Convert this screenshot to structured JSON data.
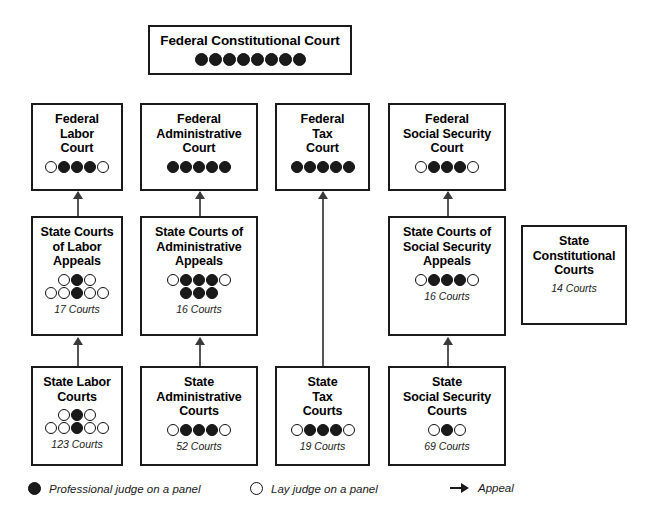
{
  "diagram": {
    "boxes": [
      {
        "id": "federal-constitutional-court",
        "title": "Federal Constitutional Court",
        "count": "",
        "x": 148,
        "y": 25,
        "w": 204,
        "h": 50,
        "dot_rows": [
          [
            "filled",
            "filled",
            "filled",
            "filled",
            "filled",
            "filled",
            "filled",
            "filled"
          ]
        ]
      },
      {
        "id": "federal-labor-court",
        "title": "Federal\nLabor\nCourt",
        "count": "",
        "x": 31,
        "y": 103,
        "w": 92,
        "h": 88,
        "dot_rows": [
          [
            "open",
            "filled",
            "filled",
            "filled",
            "open"
          ]
        ]
      },
      {
        "id": "federal-administrative-court",
        "title": "Federal\nAdministrative\nCourt",
        "count": "",
        "x": 140,
        "y": 103,
        "w": 118,
        "h": 88,
        "dot_rows": [
          [
            "filled",
            "filled",
            "filled",
            "filled",
            "filled"
          ]
        ]
      },
      {
        "id": "federal-tax-court",
        "title": "Federal\nTax\nCourt",
        "count": "",
        "x": 275,
        "y": 103,
        "w": 95,
        "h": 88,
        "dot_rows": [
          [
            "filled",
            "filled",
            "filled",
            "filled",
            "filled"
          ]
        ]
      },
      {
        "id": "federal-social-security-court",
        "title": "Federal\nSocial Security\nCourt",
        "count": "",
        "x": 388,
        "y": 103,
        "w": 118,
        "h": 88,
        "dot_rows": [
          [
            "open",
            "filled",
            "filled",
            "filled",
            "open"
          ]
        ]
      },
      {
        "id": "state-courts-of-labor-appeals",
        "title": "State Courts\nof Labor\nAppeals",
        "count": "17 Courts",
        "x": 31,
        "y": 216,
        "w": 92,
        "h": 120,
        "dot_rows": [
          [
            "open",
            "filled",
            "open"
          ],
          [
            "open",
            "open",
            "filled",
            "open",
            "open"
          ]
        ]
      },
      {
        "id": "state-courts-of-administrative-appeals",
        "title": "State Courts of\nAdministrative\nAppeals",
        "count": "16 Courts",
        "x": 140,
        "y": 216,
        "w": 118,
        "h": 120,
        "dot_rows": [
          [
            "open",
            "filled",
            "filled",
            "filled",
            "open"
          ],
          [
            "filled",
            "filled",
            "filled"
          ]
        ]
      },
      {
        "id": "state-courts-of-social-security-appeals",
        "title": "State Courts of\nSocial Security\nAppeals",
        "count": "16 Courts",
        "x": 388,
        "y": 216,
        "w": 118,
        "h": 120,
        "dot_rows": [
          [
            "open",
            "filled",
            "filled",
            "filled",
            "open"
          ]
        ]
      },
      {
        "id": "state-constitutional-courts",
        "title": "State\nConstitutional\nCourts",
        "count": "14 Courts",
        "x": 521,
        "y": 225,
        "w": 106,
        "h": 100,
        "dot_rows": []
      },
      {
        "id": "state-labor-courts",
        "title": "State Labor\nCourts",
        "count": "123 Courts",
        "x": 31,
        "y": 366,
        "w": 92,
        "h": 100,
        "dot_rows": [
          [
            "open",
            "filled",
            "open"
          ],
          [
            "open",
            "open",
            "filled",
            "open",
            "open"
          ]
        ]
      },
      {
        "id": "state-administrative-courts",
        "title": "State\nAdministrative\nCourts",
        "count": "52 Courts",
        "x": 140,
        "y": 366,
        "w": 118,
        "h": 100,
        "dot_rows": [
          [
            "open",
            "filled",
            "filled",
            "filled",
            "open"
          ]
        ]
      },
      {
        "id": "state-tax-courts",
        "title": "State\nTax\nCourts",
        "count": "19 Courts",
        "x": 275,
        "y": 366,
        "w": 95,
        "h": 100,
        "dot_rows": [
          [
            "open",
            "filled",
            "filled",
            "filled",
            "open"
          ]
        ]
      },
      {
        "id": "state-social-security-courts",
        "title": "State\nSocial Security\nCourts",
        "count": "69 Courts",
        "x": 388,
        "y": 366,
        "w": 118,
        "h": 100,
        "dot_rows": [
          [
            "open",
            "filled",
            "open"
          ]
        ]
      }
    ],
    "arrows": [
      {
        "id": "appeal-state-labor-appeals-to-federal-labor",
        "x": 77,
        "y_top": 192,
        "y_bottom": 216
      },
      {
        "id": "appeal-state-admin-appeals-to-federal-admin",
        "x": 199,
        "y_top": 192,
        "y_bottom": 216
      },
      {
        "id": "appeal-state-tax-to-federal-tax",
        "x": 322,
        "y_top": 192,
        "y_bottom": 366
      },
      {
        "id": "appeal-state-social-appeals-to-federal-social",
        "x": 447,
        "y_top": 192,
        "y_bottom": 216
      },
      {
        "id": "appeal-state-labor-to-labor-appeals",
        "x": 77,
        "y_top": 338,
        "y_bottom": 366
      },
      {
        "id": "appeal-state-admin-to-admin-appeals",
        "x": 199,
        "y_top": 338,
        "y_bottom": 366
      },
      {
        "id": "appeal-state-social-to-social-appeals",
        "x": 447,
        "y_top": 338,
        "y_bottom": 366
      }
    ]
  },
  "legend": {
    "items": [
      {
        "id": "professional-judge",
        "marker": "filled",
        "label": "Professional judge on a panel",
        "x": 28
      },
      {
        "id": "lay-judge",
        "marker": "open",
        "label": "Lay judge on a panel",
        "x": 250
      },
      {
        "id": "appeal",
        "marker": "arrow",
        "label": "Appeal",
        "x": 450
      }
    ]
  },
  "colors": {
    "stroke": "#1a1a1a",
    "fill_dot": "#1a1a1a",
    "open_dot": "#ffffff",
    "arrow": "#555555",
    "background": "#ffffff"
  }
}
